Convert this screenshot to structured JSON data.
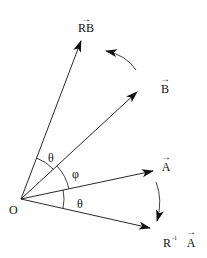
{
  "diagram": {
    "colors": {
      "stroke": "#111111",
      "background": "#ffffff"
    },
    "origin": {
      "label": "O",
      "x": 21,
      "y": 199
    },
    "vectors": [
      {
        "id": "RB",
        "label": "RB",
        "has_vector_arrow": true,
        "tip": [
          81,
          41
        ]
      },
      {
        "id": "B",
        "label": "B",
        "has_vector_arrow": true,
        "tip": [
          137,
          92
        ]
      },
      {
        "id": "A",
        "label": "A",
        "has_vector_arrow": true,
        "tip": [
          153,
          171
        ]
      },
      {
        "id": "RinvA",
        "label_prefix": "R",
        "label_superscript": "-1",
        "label": "A",
        "has_vector_arrow": true,
        "tip": [
          150,
          228
        ]
      }
    ],
    "angles": [
      {
        "id": "theta-top",
        "label": "θ",
        "between": [
          "B",
          "RB"
        ]
      },
      {
        "id": "phi",
        "label": "φ",
        "between": [
          "A",
          "B"
        ]
      },
      {
        "id": "theta-bottom",
        "label": "θ",
        "between": [
          "RinvA",
          "A"
        ]
      }
    ],
    "rotation_arrows": [
      {
        "id": "rotate-B-to-RB",
        "direction": "counterclockwise"
      },
      {
        "id": "rotate-A-to-RinvA",
        "direction": "clockwise"
      }
    ]
  }
}
